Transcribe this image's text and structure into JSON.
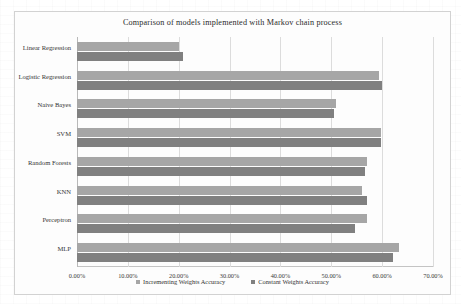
{
  "chart_data": {
    "type": "bar",
    "orientation": "horizontal",
    "title": "Comparison of models implemented with Markov chain process",
    "xlabel": "",
    "ylabel": "",
    "xlim": [
      0,
      70
    ],
    "xtick_labels": [
      "0.00%",
      "10.00%",
      "20.00%",
      "30.00%",
      "40.00%",
      "50.00%",
      "60.00%",
      "70.00%"
    ],
    "xticks": [
      0,
      10,
      20,
      30,
      40,
      50,
      60,
      70
    ],
    "grid": true,
    "legend_position": "bottom",
    "categories": [
      "Linear Regression",
      "Logistic Regression",
      "Naive Bayes",
      "SVM",
      "Random Forests",
      "KNN",
      "Perceptron",
      "MLP"
    ],
    "series": [
      {
        "name": "Incrementing Weights Accuracy",
        "color": "#a6a6a6",
        "values": [
          20.0,
          59.4,
          51.0,
          59.8,
          57.0,
          56.0,
          57.0,
          63.4
        ]
      },
      {
        "name": "Constant Weights Accuracy",
        "color": "#808080",
        "values": [
          20.8,
          60.0,
          50.5,
          59.8,
          56.6,
          57.0,
          54.6,
          62.2
        ]
      }
    ]
  },
  "legend": {
    "items": [
      {
        "label": "Incrementing Weights Accuracy",
        "color": "#a6a6a6"
      },
      {
        "label": "Constant Weights Accuracy",
        "color": "#808080"
      }
    ]
  }
}
